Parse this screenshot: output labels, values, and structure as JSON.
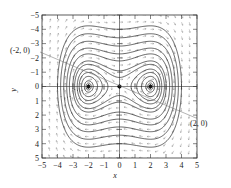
{
  "figure": {
    "kind": "phase-portrait",
    "background_color": "#ffffff",
    "ink_color": "#222222",
    "field_color": "#8a8a8a"
  },
  "axes": {
    "x_title": "x",
    "y_title": "y",
    "x_ticks": [
      "-5",
      "-4",
      "-3",
      "-2",
      "-1",
      "0",
      "1",
      "2",
      "3",
      "4",
      "5"
    ],
    "y_ticks": [
      "5",
      "4",
      "3",
      "2",
      "1",
      "0",
      "-1",
      "-2",
      "-3",
      "-4",
      "-5"
    ]
  },
  "annotations": {
    "left_point": "(-2, 0)",
    "right_point": "(2, 0)"
  },
  "chart_data": {
    "type": "line",
    "title": "",
    "xlabel": "x",
    "ylabel": "y",
    "xlim": [
      -5,
      5
    ],
    "ylim": [
      -5,
      5
    ],
    "grid": false,
    "legend": "none",
    "xticks": [
      -5,
      -4,
      -3,
      -2,
      -1,
      0,
      1,
      2,
      3,
      4,
      5
    ],
    "yticks": [
      -5,
      -4,
      -3,
      -2,
      -1,
      0,
      1,
      2,
      3,
      4,
      5
    ],
    "system": {
      "description": "Hamiltonian phase plane with a center at the origin and saddle points at (-2,0) and (2,0)",
      "hamiltonian": "H(x,y) = y^2/2 - x^2/2 + x^4/16"
    },
    "equilibria": [
      {
        "x": 0,
        "y": 0,
        "kind": "center",
        "marked": true
      },
      {
        "x": -2,
        "y": 0,
        "kind": "saddle",
        "marked": true
      },
      {
        "x": 2,
        "y": 0,
        "kind": "saddle",
        "marked": true
      }
    ],
    "annotations": [
      {
        "text": "(-2, 0)",
        "points_to": [
          -2,
          0
        ],
        "leader": true
      },
      {
        "text": "(2, 0)",
        "points_to": [
          2,
          0
        ],
        "leader": true
      }
    ],
    "level_curves": {
      "note": "trajectories are level sets H(x,y)=c",
      "separatrix_level": 1.0,
      "inner_closed_orbit_levels": [
        -0.92,
        -0.75,
        -0.52,
        -0.26,
        0.2,
        0.6
      ],
      "outer_levels_above": [
        1.6,
        2.6,
        4.0,
        5.8,
        8.0
      ],
      "outer_levels_below": [
        1.6,
        2.6,
        4.0,
        5.8,
        8.0
      ],
      "unbounded_side_levels": [
        1.6,
        2.6,
        4.0,
        5.8,
        8.0
      ]
    },
    "direction_field": {
      "shown": true,
      "glyph": "arrow",
      "grid_spacing": 0.5
    }
  }
}
